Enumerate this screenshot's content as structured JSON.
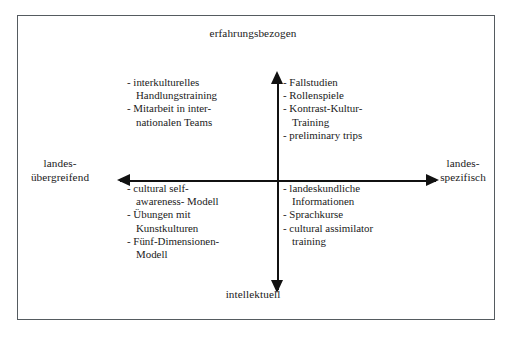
{
  "diagram": {
    "border_color": "#555b60",
    "axis_color": "#111111",
    "background": "#ffffff",
    "axes": {
      "vertical": {
        "top_label": "erfahrungsbezogen",
        "bottom_label": "intellektuell"
      },
      "horizontal": {
        "left_label": "landes-\nübergreifend",
        "right_label": "landes-\nspezifisch"
      }
    },
    "quadrants": {
      "top_left": {
        "name": "erfahrungsbezogen / landesübergreifend",
        "items": [
          "- interkulturelles\n  Handlungstraining",
          "- Mitarbeit in inter-\n  nationalen Teams"
        ]
      },
      "top_right": {
        "name": "erfahrungsbezogen / landesspezifisch",
        "items": [
          "- Fallstudien",
          "- Rollenspiele",
          "- Kontrast-Kultur-\n  Training",
          "- preliminary trips"
        ]
      },
      "bottom_left": {
        "name": "intellektuell / landesübergreifend",
        "items": [
          "- cultural self-\n  awareness- Modell",
          "- Übungen mit\n  Kunstkulturen",
          "- Fünf-Dimensionen-\n  Modell"
        ]
      },
      "bottom_right": {
        "name": "intellektuell / landesspezifisch",
        "items": [
          "- landeskundliche\n  Informationen",
          "- Sprachkurse",
          "- cultural assimilator\n  training"
        ]
      }
    },
    "icons": {
      "arrow_up": "arrow-up-icon",
      "arrow_down": "arrow-down-icon",
      "arrow_left": "arrow-left-icon",
      "arrow_right": "arrow-right-icon"
    }
  }
}
